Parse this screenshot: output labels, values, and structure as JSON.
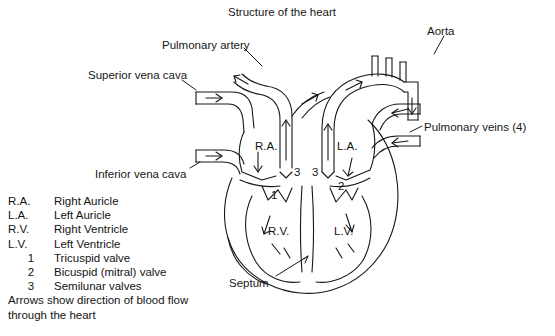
{
  "title": "Structure of the heart",
  "external_labels": [
    {
      "id": "pulmonary-artery",
      "text": "Pulmonary artery",
      "x": 162,
      "y": 39
    },
    {
      "id": "aorta",
      "text": "Aorta",
      "x": 427,
      "y": 25
    },
    {
      "id": "superior-vena-cava",
      "text": "Superior vena cava",
      "x": 88,
      "y": 69
    },
    {
      "id": "pulmonary-veins",
      "text": "Pulmonary veins (4)",
      "x": 424,
      "y": 121
    },
    {
      "id": "inferior-vena-cava",
      "text": "Inferior vena cava",
      "x": 95,
      "y": 168
    },
    {
      "id": "septum",
      "text": "Septum",
      "x": 229,
      "y": 277
    }
  ],
  "chamber_labels": [
    {
      "id": "right-auricle",
      "text": "R.A.",
      "x": 255,
      "y": 146
    },
    {
      "id": "left-auricle",
      "text": "L.A.",
      "x": 337,
      "y": 146
    },
    {
      "id": "right-ventricle",
      "text": "R.V.",
      "x": 268,
      "y": 231
    },
    {
      "id": "left-ventricle",
      "text": "L.V.",
      "x": 334,
      "y": 231
    }
  ],
  "valve_numbers": [
    {
      "id": "valve-number-3-right",
      "text": "3",
      "x": 296,
      "y": 172
    },
    {
      "id": "valve-number-3-left",
      "text": "3",
      "x": 315,
      "y": 172
    },
    {
      "id": "valve-number-2",
      "text": "2",
      "x": 340,
      "y": 186
    },
    {
      "id": "valve-number-1",
      "text": "1",
      "x": 273,
      "y": 195
    }
  ],
  "legend": {
    "rows": [
      {
        "key": "R.A.",
        "value": "Right Auricle",
        "numeric": false
      },
      {
        "key": "L.A.",
        "value": "Left Auricle",
        "numeric": false
      },
      {
        "key": "R.V.",
        "value": "Right Ventricle",
        "numeric": false
      },
      {
        "key": "L.V.",
        "value": "Left Ventricle",
        "numeric": false
      },
      {
        "key": "1",
        "value": "Tricuspid valve",
        "numeric": true
      },
      {
        "key": "2",
        "value": "Bicuspid (mitral) valve",
        "numeric": true
      },
      {
        "key": "3",
        "value": "Semilunar valves",
        "numeric": true
      }
    ],
    "note_line1": "Arrows show direction of blood flow",
    "note_line2": "through the heart"
  },
  "colors": {
    "ink": "#171717",
    "background": "#ffffff"
  }
}
